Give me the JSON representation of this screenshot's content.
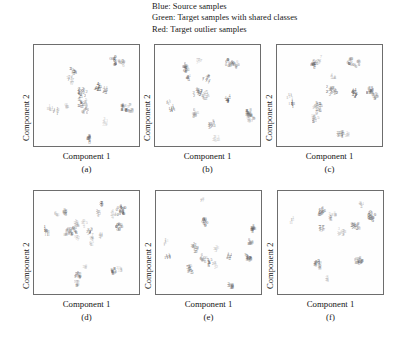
{
  "legend": {
    "lines": [
      "Blue: Source samples",
      "Green: Target samples with shared classes",
      "Red: Target outlier samples"
    ]
  },
  "axes": {
    "xlabel": "Component 1",
    "ylabel": "Component 2"
  },
  "colors": {
    "source": "#5a5a5a",
    "shared": "#8c8c8c",
    "outlier": "#b4b4b4",
    "border": "#6d6d6d",
    "text": "#161616",
    "background": "#ffffff"
  },
  "chart_data": {
    "type": "scatter",
    "title": "",
    "xlabel": "Component 1",
    "ylabel": "Component 2",
    "grid": false,
    "legend_position": "top",
    "xlim": [
      0,
      100
    ],
    "ylim": [
      0,
      100
    ],
    "marker_style": "class-digit-glyph",
    "legend_entries": [
      {
        "name": "Blue: Source samples",
        "color": "#5a5a5a"
      },
      {
        "name": "Green: Target samples with shared classes",
        "color": "#8c8c8c"
      },
      {
        "name": "Red: Target outlier samples",
        "color": "#b4b4b4"
      }
    ],
    "panels": [
      {
        "caption": "(a)",
        "clusters": [
          {
            "label": "0",
            "x": 75,
            "y": 86,
            "n": 16,
            "spread": 4.2,
            "series": "source"
          },
          {
            "label": "0",
            "x": 82,
            "y": 84,
            "n": 10,
            "spread": 3.4,
            "series": "shared"
          },
          {
            "label": "3",
            "x": 36,
            "y": 76,
            "n": 11,
            "spread": 3.2,
            "series": "source"
          },
          {
            "label": "7",
            "x": 33,
            "y": 67,
            "n": 13,
            "spread": 3.6,
            "series": "shared"
          },
          {
            "label": "4",
            "x": 60,
            "y": 60,
            "n": 14,
            "spread": 3.8,
            "series": "source"
          },
          {
            "label": "4",
            "x": 67,
            "y": 57,
            "n": 9,
            "spread": 3.0,
            "series": "shared"
          },
          {
            "label": "2",
            "x": 45,
            "y": 55,
            "n": 18,
            "spread": 4.6,
            "series": "source"
          },
          {
            "label": "5",
            "x": 44,
            "y": 45,
            "n": 20,
            "spread": 5.2,
            "series": "source"
          },
          {
            "label": "6",
            "x": 48,
            "y": 38,
            "n": 12,
            "spread": 3.6,
            "series": "shared"
          },
          {
            "label": "1",
            "x": 14,
            "y": 40,
            "n": 9,
            "spread": 3.0,
            "series": "outlier"
          },
          {
            "label": "1",
            "x": 20,
            "y": 36,
            "n": 8,
            "spread": 2.8,
            "series": "shared"
          },
          {
            "label": "6",
            "x": 30,
            "y": 42,
            "n": 6,
            "spread": 2.4,
            "series": "outlier"
          },
          {
            "label": "8",
            "x": 85,
            "y": 40,
            "n": 14,
            "spread": 3.8,
            "series": "source"
          },
          {
            "label": "9",
            "x": 91,
            "y": 39,
            "n": 11,
            "spread": 3.2,
            "series": "shared"
          },
          {
            "label": "3",
            "x": 66,
            "y": 26,
            "n": 8,
            "spread": 2.8,
            "series": "outlier"
          },
          {
            "label": "8",
            "x": 51,
            "y": 9,
            "n": 10,
            "spread": 3.0,
            "series": "source"
          }
        ]
      },
      {
        "caption": "(b)",
        "clusters": [
          {
            "label": "6",
            "x": 29,
            "y": 79,
            "n": 15,
            "spread": 3.8,
            "series": "source"
          },
          {
            "label": "7",
            "x": 40,
            "y": 87,
            "n": 8,
            "spread": 2.8,
            "series": "outlier"
          },
          {
            "label": "0",
            "x": 70,
            "y": 83,
            "n": 16,
            "spread": 4.0,
            "series": "source"
          },
          {
            "label": "0",
            "x": 76,
            "y": 82,
            "n": 9,
            "spread": 3.0,
            "series": "shared"
          },
          {
            "label": "4",
            "x": 30,
            "y": 70,
            "n": 9,
            "spread": 3.0,
            "series": "shared"
          },
          {
            "label": "7",
            "x": 48,
            "y": 67,
            "n": 13,
            "spread": 3.6,
            "series": "source"
          },
          {
            "label": "2",
            "x": 40,
            "y": 55,
            "n": 18,
            "spread": 4.8,
            "series": "source"
          },
          {
            "label": "5",
            "x": 47,
            "y": 52,
            "n": 15,
            "spread": 4.0,
            "series": "shared"
          },
          {
            "label": "4",
            "x": 68,
            "y": 48,
            "n": 10,
            "spread": 3.0,
            "series": "source"
          },
          {
            "label": "1",
            "x": 12,
            "y": 44,
            "n": 8,
            "spread": 2.8,
            "series": "outlier"
          },
          {
            "label": "1",
            "x": 15,
            "y": 38,
            "n": 10,
            "spread": 3.0,
            "series": "source"
          },
          {
            "label": "6",
            "x": 37,
            "y": 34,
            "n": 11,
            "spread": 3.2,
            "series": "shared"
          },
          {
            "label": "8",
            "x": 88,
            "y": 33,
            "n": 18,
            "spread": 4.4,
            "series": "source"
          },
          {
            "label": "9",
            "x": 90,
            "y": 28,
            "n": 12,
            "spread": 3.4,
            "series": "shared"
          },
          {
            "label": "3",
            "x": 53,
            "y": 22,
            "n": 12,
            "spread": 3.4,
            "series": "source"
          },
          {
            "label": "3",
            "x": 57,
            "y": 9,
            "n": 8,
            "spread": 2.8,
            "series": "outlier"
          }
        ]
      },
      {
        "caption": "(c)",
        "clusters": [
          {
            "label": "6",
            "x": 34,
            "y": 83,
            "n": 14,
            "spread": 3.6,
            "series": "source"
          },
          {
            "label": "7",
            "x": 39,
            "y": 87,
            "n": 7,
            "spread": 2.4,
            "series": "outlier"
          },
          {
            "label": "0",
            "x": 69,
            "y": 85,
            "n": 13,
            "spread": 3.4,
            "series": "source"
          },
          {
            "label": "0",
            "x": 76,
            "y": 83,
            "n": 10,
            "spread": 3.0,
            "series": "shared"
          },
          {
            "label": "4",
            "x": 52,
            "y": 70,
            "n": 6,
            "spread": 2.2,
            "series": "outlier"
          },
          {
            "label": "2",
            "x": 50,
            "y": 57,
            "n": 15,
            "spread": 3.8,
            "series": "source"
          },
          {
            "label": "2",
            "x": 55,
            "y": 56,
            "n": 9,
            "spread": 2.8,
            "series": "shared"
          },
          {
            "label": "4",
            "x": 73,
            "y": 54,
            "n": 12,
            "spread": 3.2,
            "series": "source"
          },
          {
            "label": "8",
            "x": 88,
            "y": 56,
            "n": 15,
            "spread": 3.8,
            "series": "source"
          },
          {
            "label": "9",
            "x": 92,
            "y": 51,
            "n": 12,
            "spread": 3.2,
            "series": "shared"
          },
          {
            "label": "1",
            "x": 11,
            "y": 50,
            "n": 9,
            "spread": 2.8,
            "series": "outlier"
          },
          {
            "label": "1",
            "x": 13,
            "y": 44,
            "n": 11,
            "spread": 3.0,
            "series": "source"
          },
          {
            "label": "5",
            "x": 38,
            "y": 40,
            "n": 20,
            "spread": 4.8,
            "series": "source"
          },
          {
            "label": "5",
            "x": 35,
            "y": 30,
            "n": 16,
            "spread": 4.2,
            "series": "shared"
          },
          {
            "label": "3",
            "x": 60,
            "y": 14,
            "n": 13,
            "spread": 3.4,
            "series": "source"
          },
          {
            "label": "3",
            "x": 66,
            "y": 12,
            "n": 7,
            "spread": 2.4,
            "series": "outlier"
          }
        ]
      },
      {
        "caption": "(d)",
        "clusters": [
          {
            "label": "2",
            "x": 63,
            "y": 88,
            "n": 9,
            "spread": 2.8,
            "series": "source"
          },
          {
            "label": "2",
            "x": 60,
            "y": 80,
            "n": 8,
            "spread": 2.6,
            "series": "shared"
          },
          {
            "label": "0",
            "x": 82,
            "y": 82,
            "n": 22,
            "spread": 4.6,
            "series": "source"
          },
          {
            "label": "4",
            "x": 74,
            "y": 79,
            "n": 7,
            "spread": 2.4,
            "series": "outlier"
          },
          {
            "label": "8",
            "x": 28,
            "y": 81,
            "n": 8,
            "spread": 2.6,
            "series": "source"
          },
          {
            "label": "6",
            "x": 20,
            "y": 78,
            "n": 6,
            "spread": 2.2,
            "series": "outlier"
          },
          {
            "label": "0",
            "x": 80,
            "y": 66,
            "n": 14,
            "spread": 3.4,
            "series": "source"
          },
          {
            "label": "5",
            "x": 40,
            "y": 70,
            "n": 9,
            "spread": 2.8,
            "series": "shared"
          },
          {
            "label": "5",
            "x": 47,
            "y": 70,
            "n": 8,
            "spread": 2.6,
            "series": "outlier"
          },
          {
            "label": "6",
            "x": 36,
            "y": 63,
            "n": 16,
            "spread": 3.8,
            "series": "source"
          },
          {
            "label": "8",
            "x": 30,
            "y": 62,
            "n": 11,
            "spread": 3.0,
            "series": "shared"
          },
          {
            "label": "2",
            "x": 52,
            "y": 63,
            "n": 10,
            "spread": 3.0,
            "series": "source"
          },
          {
            "label": "7",
            "x": 40,
            "y": 57,
            "n": 8,
            "spread": 2.6,
            "series": "outlier"
          },
          {
            "label": "7",
            "x": 55,
            "y": 56,
            "n": 7,
            "spread": 2.4,
            "series": "shared"
          },
          {
            "label": "4",
            "x": 62,
            "y": 59,
            "n": 6,
            "spread": 2.2,
            "series": "outlier"
          },
          {
            "label": "1",
            "x": 9,
            "y": 64,
            "n": 9,
            "spread": 2.8,
            "series": "source"
          },
          {
            "label": "1",
            "x": 12,
            "y": 60,
            "n": 7,
            "spread": 2.4,
            "series": "shared"
          },
          {
            "label": "5",
            "x": 54,
            "y": 50,
            "n": 6,
            "spread": 2.2,
            "series": "outlier"
          },
          {
            "label": "3",
            "x": 47,
            "y": 28,
            "n": 6,
            "spread": 2.2,
            "series": "outlier"
          },
          {
            "label": "9",
            "x": 41,
            "y": 20,
            "n": 12,
            "spread": 3.2,
            "series": "source"
          },
          {
            "label": "9",
            "x": 40,
            "y": 12,
            "n": 8,
            "spread": 2.6,
            "series": "shared"
          },
          {
            "label": "8",
            "x": 74,
            "y": 24,
            "n": 11,
            "spread": 3.0,
            "series": "source"
          },
          {
            "label": "3",
            "x": 80,
            "y": 25,
            "n": 7,
            "spread": 2.4,
            "series": "outlier"
          }
        ]
      },
      {
        "caption": "(e)",
        "clusters": [
          {
            "label": "7",
            "x": 43,
            "y": 92,
            "n": 6,
            "spread": 2.2,
            "series": "outlier"
          },
          {
            "label": "0",
            "x": 45,
            "y": 72,
            "n": 14,
            "spread": 3.2,
            "series": "source"
          },
          {
            "label": "8",
            "x": 92,
            "y": 65,
            "n": 13,
            "spread": 3.0,
            "series": "source"
          },
          {
            "label": "8",
            "x": 89,
            "y": 52,
            "n": 11,
            "spread": 2.8,
            "series": "shared"
          },
          {
            "label": "1",
            "x": 8,
            "y": 52,
            "n": 7,
            "spread": 2.4,
            "series": "outlier"
          },
          {
            "label": "2",
            "x": 36,
            "y": 46,
            "n": 15,
            "spread": 3.6,
            "series": "source"
          },
          {
            "label": "3",
            "x": 56,
            "y": 46,
            "n": 6,
            "spread": 2.2,
            "series": "outlier"
          },
          {
            "label": "1",
            "x": 10,
            "y": 38,
            "n": 10,
            "spread": 2.8,
            "series": "source"
          },
          {
            "label": "4",
            "x": 68,
            "y": 39,
            "n": 9,
            "spread": 2.6,
            "series": "shared"
          },
          {
            "label": "9",
            "x": 87,
            "y": 37,
            "n": 16,
            "spread": 3.6,
            "series": "source"
          },
          {
            "label": "6",
            "x": 44,
            "y": 36,
            "n": 12,
            "spread": 3.0,
            "series": "shared"
          },
          {
            "label": "5",
            "x": 50,
            "y": 32,
            "n": 10,
            "spread": 2.8,
            "series": "source"
          },
          {
            "label": "2",
            "x": 55,
            "y": 30,
            "n": 8,
            "spread": 2.6,
            "series": "outlier"
          },
          {
            "label": "5",
            "x": 31,
            "y": 26,
            "n": 14,
            "spread": 3.4,
            "series": "source"
          },
          {
            "label": "3",
            "x": 70,
            "y": 10,
            "n": 12,
            "spread": 3.0,
            "series": "source"
          }
        ]
      },
      {
        "caption": "(f)",
        "clusters": [
          {
            "label": "4",
            "x": 78,
            "y": 89,
            "n": 7,
            "spread": 2.4,
            "series": "outlier"
          },
          {
            "label": "6",
            "x": 40,
            "y": 82,
            "n": 14,
            "spread": 3.4,
            "series": "source"
          },
          {
            "label": "0",
            "x": 88,
            "y": 78,
            "n": 18,
            "spread": 3.8,
            "series": "source"
          },
          {
            "label": "5",
            "x": 48,
            "y": 76,
            "n": 9,
            "spread": 2.6,
            "series": "shared"
          },
          {
            "label": "8",
            "x": 52,
            "y": 78,
            "n": 6,
            "spread": 2.2,
            "series": "outlier"
          },
          {
            "label": "1",
            "x": 12,
            "y": 73,
            "n": 7,
            "spread": 2.4,
            "series": "outlier"
          },
          {
            "label": "2",
            "x": 72,
            "y": 68,
            "n": 13,
            "spread": 3.2,
            "series": "source"
          },
          {
            "label": "2",
            "x": 76,
            "y": 67,
            "n": 7,
            "spread": 2.4,
            "series": "shared"
          },
          {
            "label": "7",
            "x": 41,
            "y": 65,
            "n": 10,
            "spread": 2.8,
            "series": "source"
          },
          {
            "label": "3",
            "x": 57,
            "y": 62,
            "n": 6,
            "spread": 2.2,
            "series": "outlier"
          },
          {
            "label": "3",
            "x": 61,
            "y": 61,
            "n": 6,
            "spread": 2.2,
            "series": "shared"
          },
          {
            "label": "9",
            "x": 36,
            "y": 32,
            "n": 10,
            "spread": 2.8,
            "series": "source"
          },
          {
            "label": "9",
            "x": 39,
            "y": 29,
            "n": 7,
            "spread": 2.4,
            "series": "shared"
          },
          {
            "label": "8",
            "x": 76,
            "y": 34,
            "n": 15,
            "spread": 3.6,
            "series": "source"
          },
          {
            "label": "3",
            "x": 45,
            "y": 16,
            "n": 6,
            "spread": 2.2,
            "series": "outlier"
          }
        ]
      }
    ]
  },
  "layout": {
    "panels": [
      {
        "id": "a",
        "box_left": 33,
        "box_top": 44,
        "box_width": 107,
        "box_height": 103
      },
      {
        "id": "b",
        "box_left": 154,
        "box_top": 44,
        "box_width": 107,
        "box_height": 103
      },
      {
        "id": "c",
        "box_left": 276,
        "box_top": 44,
        "box_width": 107,
        "box_height": 103
      },
      {
        "id": "d",
        "box_left": 33,
        "box_top": 190,
        "box_width": 107,
        "box_height": 105
      },
      {
        "id": "e",
        "box_left": 155,
        "box_top": 190,
        "box_width": 107,
        "box_height": 105
      },
      {
        "id": "f",
        "box_left": 277,
        "box_top": 190,
        "box_width": 107,
        "box_height": 105
      }
    ]
  }
}
